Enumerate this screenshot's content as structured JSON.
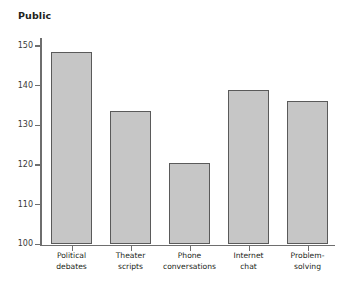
{
  "chart_data": {
    "type": "bar",
    "title": "Public",
    "xlabel": "",
    "ylabel": "",
    "categories": [
      "Political\ndebates",
      "Theater\nscripts",
      "Phone\nconversations",
      "Internet\nchat",
      "Problem-\nsolving"
    ],
    "values": [
      148.5,
      133.5,
      120.5,
      139.0,
      136.0
    ],
    "ylim": [
      100,
      152
    ],
    "yticks": [
      100,
      110,
      120,
      130,
      140,
      150
    ],
    "ytick_labels": [
      "100",
      "110",
      "120",
      "130",
      "140",
      "150"
    ],
    "grid": false,
    "legend": "none",
    "colors": {
      "bar_fill": "#c6c6c6",
      "bar_border": "#5a5a5a",
      "axis": "#6e6e6e",
      "text": "#231f20",
      "background": "#ffffff"
    }
  }
}
